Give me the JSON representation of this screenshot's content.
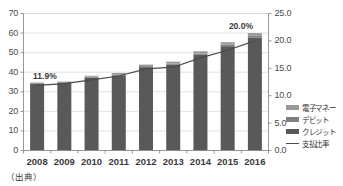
{
  "chart_data": {
    "type": "bar",
    "subtype": "stacked-bar-with-line",
    "title": "",
    "xlabel": "",
    "ylabel": "",
    "categories": [
      "2008",
      "2009",
      "2010",
      "2011",
      "2012",
      "2013",
      "2014",
      "2015",
      "2016"
    ],
    "series": [
      {
        "name": "クレジット",
        "axis": "left",
        "color": "#595959",
        "values": [
          34.0,
          34.5,
          37.2,
          38.4,
          42.6,
          43.8,
          48.9,
          53.3,
          57.6
        ]
      },
      {
        "name": "デビット",
        "axis": "left",
        "color": "#7f7f7f",
        "values": [
          0.4,
          0.4,
          0.5,
          0.5,
          0.5,
          0.6,
          0.7,
          0.8,
          1.0
        ]
      },
      {
        "name": "電子マネー",
        "axis": "left",
        "color": "#9a9a9a",
        "values": [
          0.3,
          0.3,
          0.5,
          0.7,
          0.8,
          1.0,
          1.1,
          1.2,
          1.4
        ]
      },
      {
        "name": "支払比率",
        "axis": "right",
        "type": "line",
        "color": "#4a4a4a",
        "values": [
          11.9,
          12.2,
          12.9,
          13.6,
          14.9,
          15.2,
          16.9,
          18.3,
          20.0
        ]
      }
    ],
    "y_left": {
      "min": 0,
      "max": 70,
      "step": 10,
      "ticks": [
        "0",
        "10",
        "20",
        "30",
        "40",
        "50",
        "60",
        "70"
      ]
    },
    "y_right": {
      "min": 0.0,
      "max": 25.0,
      "step": 5.0,
      "ticks": [
        "0.0",
        "5.0",
        "10.0",
        "15.0",
        "20.0",
        "25.0"
      ]
    },
    "annotations": [
      {
        "text": "11.9%",
        "category": "2008",
        "value": 11.9
      },
      {
        "text": "20.0%",
        "category": "2016",
        "value": 20.0
      }
    ],
    "grid": true,
    "legend_position": "right"
  },
  "axes": {
    "left_ticks": [
      "70",
      "60",
      "50",
      "40",
      "30",
      "20",
      "10",
      "0"
    ],
    "right_ticks": [
      "25.0",
      "20.0",
      "15.0",
      "10.0",
      "5.0",
      "0.0"
    ],
    "x_ticks": [
      "2008",
      "2009",
      "2010",
      "2011",
      "2012",
      "2013",
      "2014",
      "2015",
      "2016"
    ]
  },
  "labels": {
    "first_point": "11.9%",
    "last_point": "20.0%",
    "source": "（出典）"
  },
  "legend": {
    "items": [
      {
        "label": "電子マネー",
        "marker": "swatch",
        "color": "#9a9a9a"
      },
      {
        "label": "デビット",
        "marker": "swatch",
        "color": "#7f7f7f"
      },
      {
        "label": "クレジット",
        "marker": "swatch",
        "color": "#595959"
      },
      {
        "label": "支払比率",
        "marker": "line",
        "color": "#4a4a4a"
      }
    ]
  },
  "colors": {
    "bar_main": "#595959",
    "bar_mid": "#7f7f7f",
    "bar_top": "#9a9a9a",
    "line": "#4a4a4a",
    "grid": "#d4d4d4",
    "axis": "#8c8c8c",
    "text": "#3a3a3a",
    "background": "#ffffff"
  }
}
